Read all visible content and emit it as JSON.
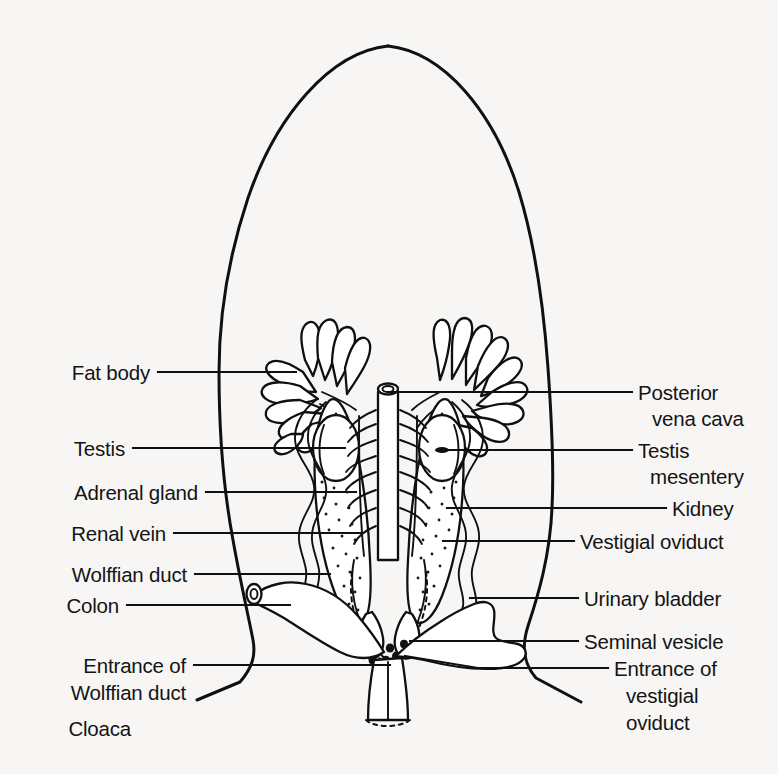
{
  "figure": {
    "background_color": "#f7f6f4",
    "ink_color": "#101010"
  },
  "labels_left": [
    {
      "id": "fat-body",
      "text": "Fat body",
      "x": 150,
      "y": 372,
      "leader_to_x": 296,
      "leader_y": 372
    },
    {
      "id": "testis",
      "text": "Testis",
      "x": 125,
      "y": 448,
      "leader_to_x": 345,
      "leader_y": 448
    },
    {
      "id": "adrenal-gland",
      "text": "Adrenal gland",
      "x": 198,
      "y": 492,
      "leader_to_x": 356,
      "leader_y": 492
    },
    {
      "id": "renal-vein",
      "text": "Renal vein",
      "x": 166,
      "y": 533,
      "leader_to_x": 363,
      "leader_y": 533
    },
    {
      "id": "wolffian-duct",
      "text": "Wolffian duct",
      "x": 187,
      "y": 574,
      "leader_to_x": 330,
      "leader_y": 574
    },
    {
      "id": "colon",
      "text": "Colon",
      "x": 119,
      "y": 605,
      "leader_to_x": 290,
      "leader_y": 605
    }
  ],
  "labels_left_multiline": [
    {
      "id": "entrance-of-wolffian-duct",
      "lines": [
        "Entrance of",
        "Wolffian duct"
      ],
      "x": 186,
      "y": 666,
      "line_height": 27,
      "leader_to_x": 390,
      "leader_y": 665
    },
    {
      "id": "cloaca",
      "lines": [
        "Cloaca"
      ],
      "x": 131,
      "y": 728,
      "line_height": 27,
      "leader_to_x": null,
      "leader_y": null
    }
  ],
  "labels_right": [
    {
      "id": "posterior-vena-cava",
      "lines": [
        "Posterior",
        "vena cava"
      ],
      "x": 638,
      "y": 398,
      "line_height": 26,
      "leader_from_x": 389,
      "leader_y": 392,
      "leader_bend": false
    },
    {
      "id": "testis-mesentery",
      "lines": [
        "Testis",
        "mesentery"
      ],
      "x": 638,
      "y": 455,
      "line_height": 26,
      "leader_from_x": 438,
      "leader_y": 450,
      "leader_bend": false
    },
    {
      "id": "kidney",
      "lines": [
        "Kidney"
      ],
      "x": 672,
      "y": 513,
      "line_height": 26,
      "leader_from_x": 447,
      "leader_y": 508,
      "leader_bend": false
    },
    {
      "id": "vestigial-oviduct",
      "lines": [
        "Vestigial oviduct"
      ],
      "x": 580,
      "y": 546,
      "line_height": 26,
      "leader_from_x": 443,
      "leader_y": 541,
      "leader_bend": false
    },
    {
      "id": "urinary-bladder",
      "lines": [
        "Urinary bladder"
      ],
      "x": 584,
      "y": 603,
      "line_height": 26,
      "leader_from_x": 470,
      "leader_y": 598,
      "leader_bend": false
    },
    {
      "id": "seminal-vesicle",
      "lines": [
        "Seminal vesicle"
      ],
      "x": 584,
      "y": 645,
      "line_height": 26,
      "leader_from_x": 410,
      "leader_y": 641,
      "leader_bend": false
    },
    {
      "id": "entrance-of-vestigial-oviduct",
      "lines": [
        "Entrance of",
        "vestigial",
        "oviduct"
      ],
      "x": 614,
      "y": 680,
      "line_height": 27,
      "leader_from_x": 405,
      "leader_y": 656,
      "leader_bend": true
    }
  ],
  "structures": [
    {
      "id": "body-outline",
      "name": "body wall outline"
    },
    {
      "id": "fat-body-left",
      "name": "left fat body"
    },
    {
      "id": "fat-body-right",
      "name": "right fat body"
    },
    {
      "id": "testis-left",
      "name": "left testis"
    },
    {
      "id": "testis-right",
      "name": "right testis"
    },
    {
      "id": "kidney-left",
      "name": "left kidney"
    },
    {
      "id": "kidney-right",
      "name": "right kidney"
    },
    {
      "id": "posterior-vena-cava",
      "name": "posterior vena cava"
    },
    {
      "id": "renal-veins",
      "name": "renal veins"
    },
    {
      "id": "testis-mesentery",
      "name": "testis mesentery"
    },
    {
      "id": "wolffian-duct-left",
      "name": "left Wolffian duct"
    },
    {
      "id": "wolffian-duct-right",
      "name": "right Wolffian duct"
    },
    {
      "id": "vestigial-oviduct-left",
      "name": "left vestigial oviduct"
    },
    {
      "id": "vestigial-oviduct-right",
      "name": "right vestigial oviduct"
    },
    {
      "id": "colon",
      "name": "colon"
    },
    {
      "id": "urinary-bladder",
      "name": "urinary bladder"
    },
    {
      "id": "seminal-vesicle",
      "name": "seminal vesicle"
    },
    {
      "id": "cloaca",
      "name": "cloaca"
    }
  ]
}
